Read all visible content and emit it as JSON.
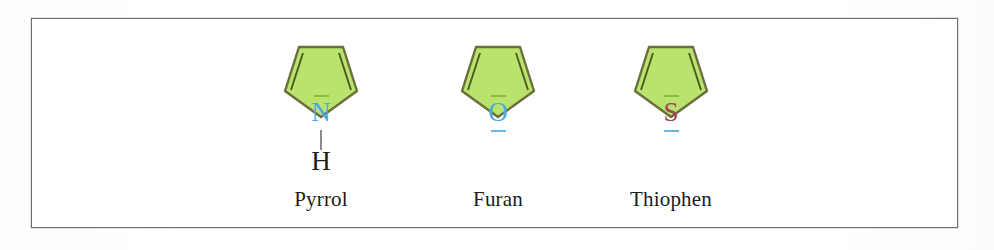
{
  "figure": {
    "frame_border_color": "#6c6f73",
    "background_color": "#ffffff",
    "ring_fill_color": "#b9e36c",
    "ring_stroke_color": "#6b6e3a"
  },
  "molecules": [
    {
      "name": "Pyrrol",
      "heteroatom": "N",
      "heteroatom_color": "#4ea8e0",
      "lone_pair_top": "—",
      "substituent": "H",
      "substituent_color": "#1c1c1c",
      "bond_color": "#8b8d90",
      "ring_type": "pentagon",
      "double_bonds": 2
    },
    {
      "name": "Furan",
      "heteroatom": "O",
      "heteroatom_color": "#4ea8e0",
      "lone_pair_top": "—",
      "lone_pair_bottom": "—",
      "ring_type": "pentagon",
      "double_bonds": 2
    },
    {
      "name": "Thiophen",
      "heteroatom": "S",
      "heteroatom_color": "#a33f57",
      "lone_pair_top": "—",
      "lone_pair_bottom": "—",
      "ring_type": "pentagon",
      "double_bonds": 2
    }
  ]
}
